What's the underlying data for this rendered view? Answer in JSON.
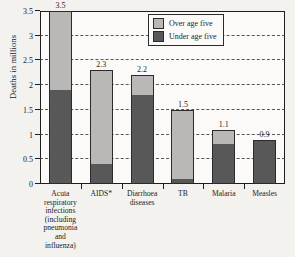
{
  "chart_data": {
    "type": "bar",
    "subtype": "stacked-vertical",
    "title": "",
    "xlabel": "",
    "ylabel": "Deaths in millions",
    "ylim": [
      0,
      3.5
    ],
    "yticks": [
      0,
      0.5,
      1,
      1.5,
      2,
      2.5,
      3,
      3.5
    ],
    "ytick_labels": [
      "0",
      "0.5",
      "1",
      "1.5",
      "2",
      "2.5",
      "3",
      "3.5"
    ],
    "grid": true,
    "legend_position": "top-right",
    "categories": [
      "Acuta respiratory infections (including pneumonia and influenza)",
      "AIDS*",
      "Diarrhoea diseases",
      "TB",
      "Malaria",
      "Measles"
    ],
    "category_lines": [
      [
        "Acuta",
        "respiratory",
        "infections",
        "(including",
        "pneumonia",
        "and",
        "influenza)"
      ],
      [
        "AIDS*"
      ],
      [
        "Diarrhoea",
        "diseases"
      ],
      [
        "TB"
      ],
      [
        "Malaria"
      ],
      [
        "Measles"
      ]
    ],
    "series": [
      {
        "name": "Under age five",
        "color": "#585858",
        "values": [
          1.9,
          0.4,
          1.8,
          0.1,
          0.8,
          0.9
        ]
      },
      {
        "name": "Over age five",
        "color": "#b9b8b6",
        "values": [
          1.6,
          1.9,
          0.4,
          1.4,
          0.3,
          0.0
        ]
      }
    ],
    "totals": [
      3.5,
      2.3,
      2.2,
      1.5,
      1.1,
      0.9
    ],
    "total_labels": [
      "3.5",
      "2.3",
      "2.2",
      "1.5",
      "1.1",
      "0.9"
    ]
  },
  "legend": {
    "items": [
      {
        "label": "Over age  five",
        "color": "#b9b8b6"
      },
      {
        "label": "Under age five",
        "color": "#585858"
      }
    ]
  },
  "colors": {
    "under_five": "#585858",
    "over_five": "#b9b8b6",
    "axis": "#1d1d1d",
    "plot_background": "#fbfaf8",
    "page_background": "#f3f2ef"
  }
}
